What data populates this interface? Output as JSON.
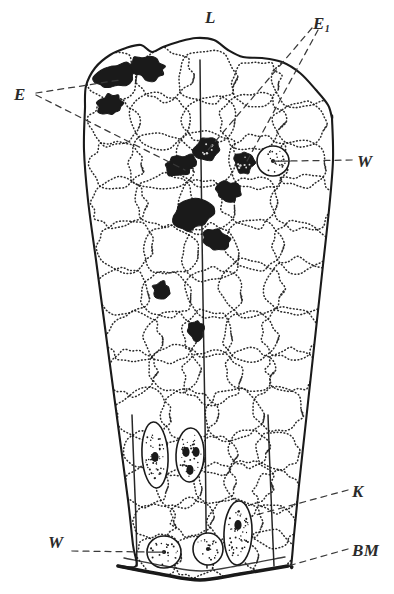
{
  "figure": {
    "kind": "histological-section-drawing",
    "background_color": "#ffffff",
    "ink_color": "#1a1a1a"
  },
  "labels": [
    {
      "id": "L",
      "text": "L",
      "sub": "",
      "x": 205,
      "y": 8,
      "name": "label-l"
    },
    {
      "id": "E1",
      "text": "E",
      "sub": "1",
      "x": 313,
      "y": 14,
      "name": "label-e1"
    },
    {
      "id": "E",
      "text": "E",
      "sub": "",
      "x": 14,
      "y": 85,
      "name": "label-e"
    },
    {
      "id": "W1",
      "text": "W",
      "sub": "",
      "x": 357,
      "y": 152,
      "name": "label-w-upper"
    },
    {
      "id": "K",
      "text": "K",
      "sub": "",
      "x": 352,
      "y": 482,
      "name": "label-k"
    },
    {
      "id": "W2",
      "text": "W",
      "sub": "",
      "x": 48,
      "y": 533,
      "name": "label-w-lower"
    },
    {
      "id": "BM",
      "text": "BM",
      "sub": "",
      "x": 352,
      "y": 541,
      "name": "label-bm"
    }
  ],
  "chart_data": {
    "type": "diagram",
    "title": "",
    "outline": {
      "left_edge": [
        [
          85,
          108
        ],
        [
          84,
          150
        ],
        [
          88,
          200
        ],
        [
          96,
          260
        ],
        [
          104,
          320
        ],
        [
          112,
          380
        ],
        [
          120,
          440
        ],
        [
          128,
          500
        ],
        [
          133,
          545
        ],
        [
          136,
          566
        ]
      ],
      "right_edge": [
        [
          332,
          118
        ],
        [
          333,
          160
        ],
        [
          329,
          210
        ],
        [
          323,
          265
        ],
        [
          317,
          320
        ],
        [
          311,
          375
        ],
        [
          305,
          430
        ],
        [
          299,
          485
        ],
        [
          294,
          535
        ],
        [
          291,
          566
        ]
      ],
      "top_edge": [
        [
          85,
          108
        ],
        [
          86,
          86
        ],
        [
          95,
          68
        ],
        [
          110,
          55
        ],
        [
          126,
          48
        ],
        [
          141,
          45
        ],
        [
          152,
          52
        ],
        [
          163,
          47
        ],
        [
          178,
          42
        ],
        [
          196,
          38
        ],
        [
          214,
          40
        ],
        [
          228,
          50
        ],
        [
          243,
          57
        ],
        [
          262,
          58
        ],
        [
          282,
          62
        ],
        [
          300,
          73
        ],
        [
          316,
          90
        ],
        [
          328,
          105
        ],
        [
          332,
          118
        ]
      ]
    },
    "baseline": {
      "label": "BM",
      "points": [
        [
          118,
          566
        ],
        [
          160,
          574
        ],
        [
          200,
          580
        ],
        [
          240,
          574
        ],
        [
          288,
          566
        ]
      ],
      "inner_points": [
        [
          124,
          558
        ],
        [
          165,
          566
        ],
        [
          202,
          571
        ],
        [
          242,
          565
        ],
        [
          285,
          557
        ]
      ]
    },
    "vertical_struts": [
      [
        [
          200,
          60
        ],
        [
          201,
          160
        ],
        [
          203,
          300
        ],
        [
          205,
          420
        ],
        [
          206,
          520
        ],
        [
          207,
          568
        ]
      ],
      [
        [
          132,
          415
        ],
        [
          134,
          470
        ],
        [
          136,
          520
        ],
        [
          137,
          566
        ]
      ],
      [
        [
          268,
          415
        ],
        [
          270,
          470
        ],
        [
          272,
          520
        ],
        [
          274,
          566
        ]
      ]
    ],
    "pigment_blobs": [
      {
        "cx": 114,
        "cy": 76,
        "rx": 20,
        "ry": 12,
        "rot": -18,
        "name": "pigment-blob-1"
      },
      {
        "cx": 148,
        "cy": 68,
        "rx": 18,
        "ry": 11,
        "rot": 8,
        "name": "pigment-blob-2"
      },
      {
        "cx": 110,
        "cy": 105,
        "rx": 12,
        "ry": 10,
        "rot": -10,
        "name": "pigment-blob-3"
      },
      {
        "cx": 207,
        "cy": 150,
        "rx": 13,
        "ry": 11,
        "rot": 0,
        "name": "granule-cell-1"
      },
      {
        "cx": 244,
        "cy": 163,
        "rx": 10,
        "ry": 10,
        "rot": 0,
        "name": "granule-cell-2"
      },
      {
        "cx": 180,
        "cy": 165,
        "rx": 16,
        "ry": 10,
        "rot": -12,
        "name": "pigment-blob-4"
      },
      {
        "cx": 228,
        "cy": 192,
        "rx": 12,
        "ry": 10,
        "rot": 14,
        "name": "pigment-blob-5"
      },
      {
        "cx": 192,
        "cy": 215,
        "rx": 20,
        "ry": 14,
        "rot": -20,
        "name": "pigment-blob-6"
      },
      {
        "cx": 216,
        "cy": 240,
        "rx": 13,
        "ry": 10,
        "rot": 12,
        "name": "pigment-blob-7"
      },
      {
        "cx": 161,
        "cy": 290,
        "rx": 8,
        "ry": 9,
        "rot": 0,
        "name": "pigment-blob-8"
      },
      {
        "cx": 196,
        "cy": 330,
        "rx": 8,
        "ry": 10,
        "rot": -8,
        "name": "pigment-blob-9"
      }
    ],
    "stippled_round_cells": [
      {
        "cx": 273,
        "cy": 161,
        "rx": 16,
        "ry": 15,
        "name": "round-cell-w-upper"
      },
      {
        "cx": 164,
        "cy": 552,
        "rx": 17,
        "ry": 16,
        "name": "round-cell-w-lower-a"
      },
      {
        "cx": 208,
        "cy": 549,
        "rx": 15,
        "ry": 16,
        "name": "round-cell-w-lower-b"
      }
    ],
    "stippled_elongate_cells": [
      {
        "cx": 155,
        "cy": 455,
        "rx": 13,
        "ry": 33,
        "rot": -3,
        "nuclei": [
          [
            155,
            457
          ]
        ],
        "name": "elongate-cell-k-1"
      },
      {
        "cx": 190,
        "cy": 455,
        "rx": 14,
        "ry": 27,
        "rot": 2,
        "nuclei": [
          [
            186,
            452
          ],
          [
            196,
            452
          ],
          [
            190,
            470
          ]
        ],
        "name": "elongate-cell-k-2"
      },
      {
        "cx": 238,
        "cy": 533,
        "rx": 14,
        "ry": 32,
        "rot": 2,
        "nuclei": [
          [
            238,
            525
          ]
        ],
        "name": "elongate-cell-k-3"
      }
    ],
    "leader_lines": [
      {
        "from": "E",
        "points": [
          [
            36,
            93
          ],
          [
            120,
            80
          ]
        ],
        "style": "dashed",
        "name": "leader-e-upper"
      },
      {
        "from": "E",
        "points": [
          [
            36,
            95
          ],
          [
            185,
            170
          ]
        ],
        "style": "dashed",
        "name": "leader-e-lower"
      },
      {
        "from": "E1",
        "points": [
          [
            312,
            28
          ],
          [
            208,
            150
          ]
        ],
        "style": "dashed",
        "name": "leader-e1-a"
      },
      {
        "from": "E1",
        "points": [
          [
            318,
            30
          ],
          [
            246,
            163
          ]
        ],
        "style": "dashed",
        "name": "leader-e1-b"
      },
      {
        "from": "W1",
        "points": [
          [
            352,
            160
          ],
          [
            290,
            161
          ]
        ],
        "style": "dashed",
        "name": "leader-w-upper-dash"
      },
      {
        "from": "W1",
        "points": [
          [
            290,
            161
          ],
          [
            273,
            161
          ]
        ],
        "style": "solid",
        "name": "leader-w-upper-solid"
      },
      {
        "from": "K",
        "points": [
          [
            348,
            490
          ],
          [
            252,
            516
          ]
        ],
        "style": "dashed",
        "name": "leader-k"
      },
      {
        "from": "W2",
        "points": [
          [
            72,
            551
          ],
          [
            148,
            552
          ]
        ],
        "style": "dashed",
        "name": "leader-w-lower-dash"
      },
      {
        "from": "W2",
        "points": [
          [
            148,
            552
          ],
          [
            164,
            552
          ]
        ],
        "style": "solid",
        "name": "leader-w-lower-solid"
      },
      {
        "from": "BM",
        "points": [
          [
            348,
            549
          ],
          [
            288,
            566
          ]
        ],
        "style": "dashed",
        "name": "leader-bm"
      }
    ]
  }
}
